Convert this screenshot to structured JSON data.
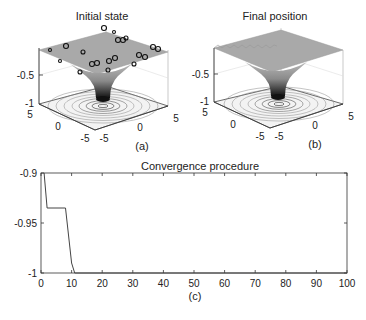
{
  "panels": {
    "a": {
      "title": "Initial state",
      "label": "(a)",
      "zticks": [
        "-0.5",
        "-1"
      ],
      "xticks": [
        "-5",
        "0",
        "5"
      ],
      "yticks": [
        "5",
        "0",
        "-5"
      ]
    },
    "b": {
      "title": "Final position",
      "label": "(b)",
      "zticks": [
        "-0.5",
        "-1"
      ],
      "xticks": [
        "-5",
        "0",
        "5"
      ],
      "yticks": [
        "5",
        "0",
        "-5"
      ]
    },
    "c": {
      "title": "Convergence procedure",
      "label": "(c)"
    }
  },
  "chart_data": [
    {
      "type": "surface",
      "title": "Initial state",
      "panel_label": "(a)",
      "zlim": [
        -1,
        0
      ],
      "zticks": [
        -1,
        -0.5
      ],
      "xticks": [
        -5,
        0,
        5
      ],
      "yticks": [
        -5,
        0,
        5
      ],
      "annotations": "3D funnel-shaped surface with contour rings on the base; particles (circle markers) scattered over the upper plateau"
    },
    {
      "type": "surface",
      "title": "Final position",
      "panel_label": "(b)",
      "zlim": [
        -1,
        0
      ],
      "zticks": [
        -1,
        -0.5
      ],
      "xticks": [
        -5,
        0,
        5
      ],
      "yticks": [
        -5,
        0,
        5
      ],
      "annotations": "Same funnel surface; particles converged at the bottom minimum"
    },
    {
      "type": "line",
      "title": "Convergence procedure",
      "panel_label": "(c)",
      "xlabel": "",
      "ylabel": "",
      "xlim": [
        0,
        100
      ],
      "ylim": [
        -1,
        -0.9
      ],
      "xticks": [
        0,
        10,
        20,
        30,
        40,
        50,
        60,
        70,
        80,
        90,
        100
      ],
      "yticks": [
        -1,
        -0.95,
        -0.9
      ],
      "grid": false,
      "x": [
        1,
        2,
        8,
        10,
        11,
        100
      ],
      "values": [
        -0.9,
        -0.935,
        -0.935,
        -0.99,
        -1,
        -1
      ]
    }
  ]
}
